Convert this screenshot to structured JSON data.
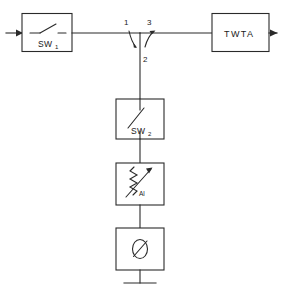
{
  "diagram": {
    "blocks": [
      {
        "id": "sw1",
        "label": "SW",
        "subscript": "1",
        "symbol": "switch-blade",
        "role": "input-switch"
      },
      {
        "id": "twta",
        "label": "TWTA",
        "symbol": "amplifier-block",
        "role": "traveling-wave-tube-amplifier"
      },
      {
        "id": "sw2",
        "label": "SW",
        "subscript": "2",
        "symbol": "switch-blade",
        "role": "branch-switch"
      },
      {
        "id": "attenuator",
        "label": "Al",
        "symbol": "variable-attenuator",
        "role": "variable-attenuator"
      },
      {
        "id": "phaseshifter",
        "label": "Ø",
        "symbol": "phase-shifter",
        "role": "phase-shifter"
      }
    ],
    "junction": {
      "name": "circulator-junction",
      "ports": [
        {
          "id": "port1",
          "label": "1",
          "position": "left-top"
        },
        {
          "id": "port3",
          "label": "3",
          "position": "right-top"
        },
        {
          "id": "port2",
          "label": "2",
          "position": "below"
        }
      ]
    },
    "terminations": [
      {
        "id": "ground",
        "symbol": "ground-bar",
        "label": ""
      }
    ],
    "ports": [
      {
        "id": "input",
        "symbol": "arrow-right",
        "label": "",
        "side": "left"
      },
      {
        "id": "output",
        "symbol": "arrow-right",
        "label": "",
        "side": "right"
      }
    ],
    "colors": {
      "line": "#2a2a2a",
      "background": "#ffffff",
      "text": "#1a1a1a"
    }
  }
}
